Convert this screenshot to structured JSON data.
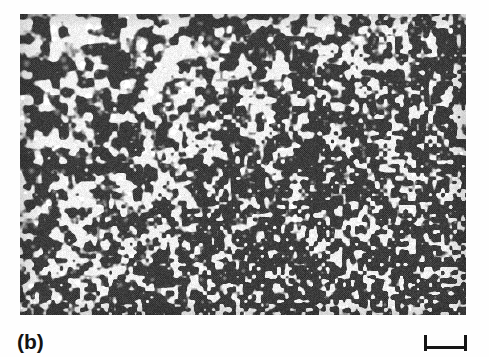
{
  "figure": {
    "panel_label": "(b)",
    "background_color": "#fefefe",
    "ink_color": "#151515"
  },
  "micrograph": {
    "name": "electron-micrograph-panel",
    "x": 20,
    "y": 14,
    "width": 446,
    "height": 301,
    "description": "Halftone-printed transmission electron micrograph showing a dense dispersion of bright irregular precipitate particles on a dark gray matrix.",
    "matrix_color": "#4d4d4d",
    "particle_color": "#f2f2f2",
    "dark_shadow_color": "#232323",
    "mean_gray": "#555555",
    "texture": {
      "type": "mottled-precipitate-dispersion",
      "halftone_screen": true,
      "halftone_pitch_px": 2.1,
      "coarse_region": "top-left",
      "fine_region": "bottom-right",
      "coarse_feature_px": 11,
      "fine_feature_px": 5,
      "particle_count_estimate": 2600,
      "area_fraction_bright": 0.3
    }
  },
  "scale_bar": {
    "name": "scale-bar",
    "x": 424,
    "y": 335,
    "length_px": 43,
    "cap_height_px": 16,
    "rule_thickness_px": 3,
    "caption": ""
  }
}
